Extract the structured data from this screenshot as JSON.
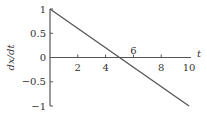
{
  "chart_data": {
    "type": "line",
    "title": "",
    "xlabel": "t",
    "ylabel": "dx/dt",
    "xlim": [
      0,
      10
    ],
    "ylim": [
      -1,
      1
    ],
    "grid": false,
    "x_ticks": [
      2,
      4,
      6,
      8,
      10
    ],
    "x_tick_labels": [
      "2",
      "4",
      "6",
      "8",
      "10"
    ],
    "y_ticks": [
      1,
      0.5,
      0,
      -0.5,
      -1
    ],
    "y_tick_labels": [
      "1",
      "0.5",
      "0",
      "−0.5",
      "−1"
    ],
    "series": [
      {
        "name": "dx/dt",
        "x": [
          0,
          10
        ],
        "y": [
          1,
          -1
        ]
      }
    ],
    "annotations": [
      "x-intercept at t = 5"
    ]
  },
  "colors": {
    "line": "#555555",
    "axis": "#555555",
    "text": "#333333"
  }
}
